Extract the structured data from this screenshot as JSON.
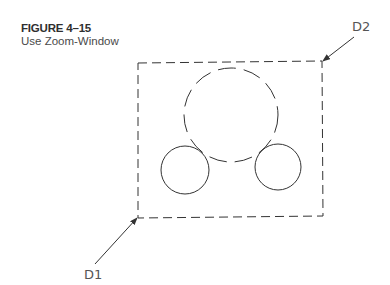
{
  "figure": {
    "number": "FIGURE 4–15",
    "title": "Use Zoom-Window"
  },
  "drawing": {
    "window_rect": {
      "x1": 138,
      "y1": 62,
      "x2": 322,
      "y2": 217,
      "style": "dashed"
    },
    "circles": [
      {
        "name": "large-circle",
        "cx": 231,
        "cy": 115,
        "r": 47,
        "style": "dashed"
      },
      {
        "name": "left-small-circle",
        "cx": 185,
        "cy": 170,
        "r": 24,
        "style": "solid"
      },
      {
        "name": "right-small-circle",
        "cx": 278,
        "cy": 167,
        "r": 23,
        "style": "solid"
      }
    ],
    "points": [
      {
        "label": "D1",
        "x": 138,
        "y": 217,
        "label_x": 85,
        "label_y": 278
      },
      {
        "label": "D2",
        "x": 322,
        "y": 62,
        "label_x": 352,
        "label_y": 30
      }
    ],
    "line_color": "#333333"
  }
}
